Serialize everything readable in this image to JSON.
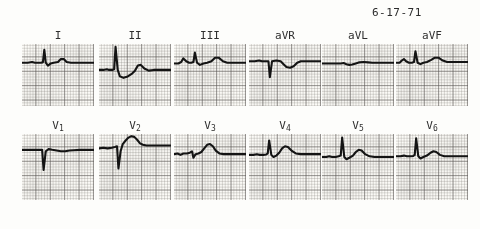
{
  "document": {
    "kind": "12-lead electrocardiogram tracing",
    "date_stamp": "6-17-71"
  },
  "style": {
    "paper_color": "#fcfbf7",
    "trace_color": "#141414",
    "grid_major_color": "#5a5654",
    "grid_minor_color": "#787470",
    "label_color": "#2f2f2f"
  },
  "chart_data": {
    "type": "line",
    "subtitle": "6-17-71",
    "xlabel": "time",
    "ylabel": "voltage",
    "grid": true,
    "legend": "none",
    "xlim": [
      0,
      100
    ],
    "ylim": [
      -50,
      50
    ],
    "layout": {
      "rows": 2,
      "cols": 6
    },
    "row_labels": [
      [
        "I",
        "II",
        "III",
        "aVR",
        "aVL",
        "aVF"
      ],
      [
        "V1",
        "V2",
        "V3",
        "V4",
        "V5",
        "V6"
      ]
    ],
    "series": [
      {
        "name": "I",
        "label_html": "I",
        "baseline": 26,
        "morphology": "small upright P, tall narrow R wave, low upright T wave",
        "points": "0,26 8,26 14,25 18,26 26,26 29,25.5 31,8 33,26 36,30 40,27 44,26 50,25 54,21 58,21 62,25 68,26 78,26 88,26 100,26"
      },
      {
        "name": "II",
        "label_html": "II",
        "baseline": 36,
        "morphology": "very tall R wave, deep S, upright T wave",
        "points": "0,36 6,36 11,35 14,36 19,36 21,35 23,4 26,36 29,45 34,47 40,45 46,41 50,37 54,30 58,29 63,34 69,37 76,36 86,36 100,36"
      },
      {
        "name": "III",
        "label_html": "III",
        "baseline": 26,
        "morphology": "notched P, tall R wave, broad upright T",
        "points": "0,27 6,27 10,25 13,20 17,24 21,26 24,26 27,25 29,12 32,26 36,29 41,27 46,26 52,24 57,19 62,19 68,24 74,26 82,26 92,26 100,26"
      },
      {
        "name": "aVR",
        "label_html": "aVR",
        "baseline": 24,
        "morphology": "deep negative QS complex, inverted T wave",
        "points": "0,24 8,24 14,23 18,24 24,24 27,24 29,46 32,24 38,23 44,24 48,28 52,32 57,33 62,31 67,26 72,24 80,24 90,24 100,24"
      },
      {
        "name": "aVL",
        "label_html": "aVL",
        "baseline": 26,
        "morphology": "low-voltage flat complex, minimal deflection",
        "points": "0,27 8,27 14,27 20,27 26,27 30,26.5 34,28 38,29 42,28.5 47,27 52,25.5 58,25 64,25.5 70,26 78,26 88,26 100,26"
      },
      {
        "name": "aVF",
        "label_html": "aVF",
        "baseline": 25,
        "morphology": "upright P, tall R wave, rounded upright T",
        "points": "0,26 5,26 8,23 11,21 14,24 18,26 22,26 25,25 27,10 30,26 34,28 38,26 43,25 49,22 54,19 59,19 65,23 71,25 80,25 90,25 100,25"
      },
      {
        "name": "V1",
        "label_html": "V1",
        "baseline": 22,
        "morphology": "deep QS complex, flat shallow T wave",
        "points": "0,22 8,22 14,22 20,22 25,22 28,22 30,50 33,24 37,21 42,22 48,23 54,24 60,24 66,23 72,22.5 80,22 90,22 100,22"
      },
      {
        "name": "V2",
        "label_html": "V2",
        "baseline": 18,
        "morphology": "deep S wave with marked ST elevation and tall broad T",
        "points": "0,20 6,19 12,20 18,19 22,18 25,17 27,48 30,24 33,14 37,9 41,5 45,3 49,4 53,8 57,13 61,15 66,16 72,16 80,16 90,16 100,16"
      },
      {
        "name": "V3",
        "label_html": "V3",
        "baseline": 27,
        "morphology": "small r, S wave, prominent upright T wave",
        "points": "0,28 5,27 9,29 13,27 18,27 22,26 25,24 27,33 30,28 34,27 38,25 42,20 46,15 50,14 54,17 58,23 63,27 69,28 76,28 86,28 100,28"
      },
      {
        "name": "V4",
        "label_html": "V4",
        "baseline": 28,
        "morphology": "tall narrow R wave, prominent broad T wave",
        "points": "0,29 6,29 11,28 15,29 20,29 24,28.5 26,27 28,9 31,29 34,32 38,30 42,26 46,20 50,17 54,18 59,23 65,27 72,28 82,28 92,28 100,28"
      },
      {
        "name": "V5",
        "label_html": "V5",
        "baseline": 31,
        "morphology": "very tall R wave, upright T wave, clear P wave",
        "points": "0,32 6,32 10,31 14,32 19,32 23,31 26,30 28,5 31,32 34,35 38,33 43,30 47,25 51,22 55,23 60,28 66,31 73,32 82,32 92,32 100,32"
      },
      {
        "name": "V6",
        "label_html": "V6",
        "baseline": 30,
        "morphology": "tall R wave, modest upright T wave",
        "points": "0,31 6,31 11,30 15,31 20,31 24,30.5 26,29 28,6 31,31 34,34 38,32 43,30 48,26 52,24 56,25 61,29 67,31 74,31 84,31 94,31 100,31"
      }
    ]
  },
  "leads": [
    {
      "id": "I",
      "label": "I",
      "x": 22,
      "y": 30,
      "w": 72,
      "h": 62
    },
    {
      "id": "II",
      "label": "II",
      "x": 99,
      "y": 30,
      "w": 72,
      "h": 62
    },
    {
      "id": "III",
      "label": "III",
      "x": 174,
      "y": 30,
      "w": 72,
      "h": 62
    },
    {
      "id": "aVR",
      "label": "aVR",
      "x": 249,
      "y": 30,
      "w": 72,
      "h": 62
    },
    {
      "id": "aVL",
      "label": "aVL",
      "x": 322,
      "y": 30,
      "w": 72,
      "h": 62
    },
    {
      "id": "aVF",
      "label": "aVF",
      "x": 396,
      "y": 30,
      "w": 72,
      "h": 62
    },
    {
      "id": "V1",
      "label": "V",
      "sub": "1",
      "x": 22,
      "y": 120,
      "w": 72,
      "h": 66
    },
    {
      "id": "V2",
      "label": "V",
      "sub": "2",
      "x": 99,
      "y": 120,
      "w": 72,
      "h": 66
    },
    {
      "id": "V3",
      "label": "V",
      "sub": "3",
      "x": 174,
      "y": 120,
      "w": 72,
      "h": 66
    },
    {
      "id": "V4",
      "label": "V",
      "sub": "4",
      "x": 249,
      "y": 120,
      "w": 72,
      "h": 66
    },
    {
      "id": "V5",
      "label": "V",
      "sub": "5",
      "x": 322,
      "y": 120,
      "w": 72,
      "h": 66
    },
    {
      "id": "V6",
      "label": "V",
      "sub": "6",
      "x": 396,
      "y": 120,
      "w": 72,
      "h": 66
    }
  ],
  "date_position": {
    "x": 372,
    "y": 6
  }
}
